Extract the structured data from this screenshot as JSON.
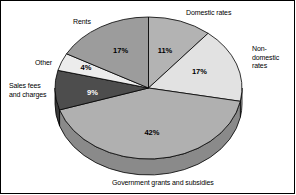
{
  "chart_data": {
    "type": "pie",
    "title": "",
    "subtitle": "",
    "xlabel": "",
    "ylabel": "",
    "legend_position": "none",
    "grid": false,
    "style": "3d-exploded-grayscale",
    "unit": "%",
    "categories": [
      "Domestic rates",
      "Non-domestic rates",
      "Government grants and subsidies",
      "Sales fees and charges",
      "Other",
      "Rents"
    ],
    "values": [
      11,
      17,
      42,
      9,
      4,
      17
    ],
    "slices": [
      {
        "label": "Domestic rates",
        "label_lines": "Domestic rates",
        "value": 11,
        "value_text": "11%",
        "color": "#b3b3b3",
        "side_color": "#8f8f8f",
        "start_deg": 0,
        "end_deg": 39.6
      },
      {
        "label": "Non-domestic rates",
        "label_lines": "Non-\ndomestic\nrates",
        "value": 17,
        "value_text": "17%",
        "color": "#e2e2e2",
        "side_color": "#b8b8b8",
        "start_deg": 39.6,
        "end_deg": 100.8
      },
      {
        "label": "Government grants and subsidies",
        "label_lines": "Government grants and subsidies",
        "value": 42,
        "value_text": "42%",
        "color": "#b0b0b0",
        "side_color": "#8a8a8a",
        "start_deg": 100.8,
        "end_deg": 252.0
      },
      {
        "label": "Sales fees and charges",
        "label_lines": "Sales fees\nand charges",
        "value": 9,
        "value_text": "9%",
        "color": "#4d4d4d",
        "side_color": "#3a3a3a",
        "start_deg": 252.0,
        "end_deg": 284.4
      },
      {
        "label": "Other",
        "label_lines": "Other",
        "value": 4,
        "value_text": "4%",
        "color": "#ececec",
        "side_color": "#c0c0c0",
        "start_deg": 284.4,
        "end_deg": 298.8
      },
      {
        "label": "Rents",
        "label_lines": "Rents",
        "value": 17,
        "value_text": "17%",
        "color": "#9c9c9c",
        "side_color": "#7a7a7a",
        "start_deg": 298.8,
        "end_deg": 360.0
      }
    ]
  },
  "labels": {
    "domestic_rates": "Domestic rates",
    "non_domestic_rates": "Non-\ndomestic\nrates",
    "rents": "Rents",
    "other": "Other",
    "sales_fees_and_charges": "Sales fees\nand charges",
    "government_grants": "Government grants and subsidies"
  },
  "values": {
    "domestic_rates": "11%",
    "non_domestic_rates": "17%",
    "rents": "17%",
    "other": "4%",
    "sales_fees_and_charges": "9%",
    "government_grants": "42%"
  },
  "colors": {
    "outline": "#000000",
    "background": "#ffffff",
    "text": "#000000",
    "domestic_rates": "#b3b3b3",
    "non_domestic_rates": "#e2e2e2",
    "government_grants": "#b0b0b0",
    "sales_fees_and_charges": "#4d4d4d",
    "other": "#ececec",
    "rents": "#9c9c9c"
  }
}
